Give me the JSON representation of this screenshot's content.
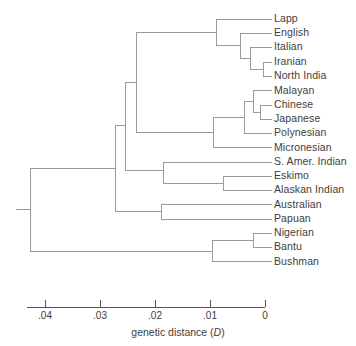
{
  "figure": {
    "type": "dendrogram",
    "axis": {
      "caption_prefix": "genetic distance (",
      "caption_symbol": "D",
      "caption_suffix": ")",
      "label": "genetic distance (D)",
      "direction": "right-to-left",
      "min": 0,
      "max": 0.045,
      "ticks": [
        {
          "value": ".04",
          "numeric": 0.04
        },
        {
          "value": ".03",
          "numeric": 0.03
        },
        {
          "value": ".02",
          "numeric": 0.02
        },
        {
          "value": ".01",
          "numeric": 0.01
        },
        {
          "value": "0",
          "numeric": 0
        }
      ]
    },
    "line_color": "#9a9a9a",
    "text_color": "#3d3d3d",
    "taxa": [
      {
        "label": "Lapp",
        "distance": 0.0
      },
      {
        "label": "English",
        "distance": 0.0
      },
      {
        "label": "Italian",
        "distance": 0.0
      },
      {
        "label": "Iranian",
        "distance": 0.0
      },
      {
        "label": "North India",
        "distance": 0.0
      },
      {
        "label": "Malayan",
        "distance": 0.0
      },
      {
        "label": "Chinese",
        "distance": 0.0
      },
      {
        "label": "Japanese",
        "distance": 0.0
      },
      {
        "label": "Polynesian",
        "distance": 0.0
      },
      {
        "label": "Micronesian",
        "distance": 0.0
      },
      {
        "label": "S. Amer. Indian",
        "distance": 0.0
      },
      {
        "label": "Eskimo",
        "distance": 0.0
      },
      {
        "label": "Alaskan Indian",
        "distance": 0.0
      },
      {
        "label": "Australian",
        "distance": 0.0
      },
      {
        "label": "Papuan",
        "distance": 0.0
      },
      {
        "label": "Nigerian",
        "distance": 0.0
      },
      {
        "label": "Bantu",
        "distance": 0.0
      },
      {
        "label": "Bushman",
        "distance": 0.0
      }
    ],
    "nodes": [
      {
        "name": "iranian-northindia",
        "children": [
          "Iranian",
          "North India"
        ],
        "distance": 0.0018
      },
      {
        "name": "italian-iranian-clade",
        "children": [
          "Italian",
          "iranian-northindia"
        ],
        "distance": 0.0035
      },
      {
        "name": "english-clade",
        "children": [
          "English",
          "italian-iranian-clade"
        ],
        "distance": 0.0051
      },
      {
        "name": "caucasoid",
        "children": [
          "Lapp",
          "english-clade"
        ],
        "distance": 0.0089
      },
      {
        "name": "chinese-japanese",
        "children": [
          "Chinese",
          "Japanese"
        ],
        "distance": 0.0009
      },
      {
        "name": "malayan-clade",
        "children": [
          "Malayan",
          "chinese-japanese"
        ],
        "distance": 0.0021
      },
      {
        "name": "polynesian-clade",
        "children": [
          "malayan-clade",
          "Polynesian"
        ],
        "distance": 0.0038
      },
      {
        "name": "mongoloid",
        "children": [
          "polynesian-clade",
          "Micronesian"
        ],
        "distance": 0.0095
      },
      {
        "name": "caucasoid-mongoloid",
        "children": [
          "caucasoid",
          "mongoloid"
        ],
        "distance": 0.0209
      },
      {
        "name": "eskimo-alaskan",
        "children": [
          "Eskimo",
          "Alaskan Indian"
        ],
        "distance": 0.0077
      },
      {
        "name": "amerind-clade",
        "children": [
          "caucasoid-mongoloid",
          "S. Amer. Indian",
          "eskimo-alaskan"
        ],
        "distance": 0.0236
      },
      {
        "name": "australian-papuan",
        "children": [
          "Australian",
          "Papuan"
        ],
        "distance": 0.0191
      },
      {
        "name": "non-african",
        "children": [
          "amerind-clade",
          "australian-papuan"
        ],
        "distance": 0.0255
      },
      {
        "name": "nigerian-bantu",
        "children": [
          "Nigerian",
          "Bantu"
        ],
        "distance": 0.0021
      },
      {
        "name": "african",
        "children": [
          "nigerian-bantu",
          "Bushman"
        ],
        "distance": 0.0096
      },
      {
        "name": "root",
        "children": [
          "non-african",
          "african"
        ],
        "distance": 0.0428
      }
    ]
  }
}
